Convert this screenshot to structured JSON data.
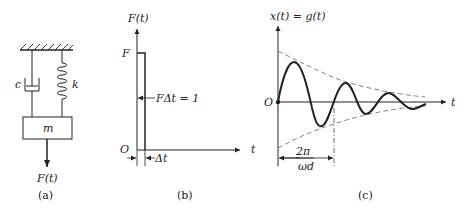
{
  "figure": {
    "panels": [
      {
        "id": "a",
        "caption": "(a)",
        "title": "Spring-mass-damper system",
        "labels": {
          "damper": "c",
          "spring": "k",
          "mass": "m",
          "force": "F(t)"
        }
      },
      {
        "id": "b",
        "caption": "(b)",
        "title": "Unit impulse force",
        "labels": {
          "y_axis": "F(t)",
          "x_axis": "t",
          "origin": "O",
          "height": "F",
          "area": "FΔt = 1",
          "width": "Δt"
        }
      },
      {
        "id": "c",
        "caption": "(c)",
        "title": "Impulse response",
        "labels": {
          "y_axis": "x(t) = g(t)",
          "x_axis": "t",
          "origin": "O",
          "period_num": "2π",
          "period_den": "ωd"
        }
      }
    ]
  },
  "colors": {
    "ink": "#222222",
    "background": "#ffffff",
    "envelope": "#777777"
  }
}
